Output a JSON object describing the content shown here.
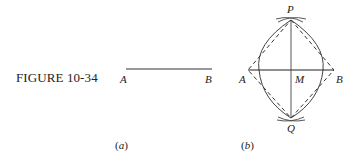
{
  "figure": {
    "caption": "FIGURE 10-34",
    "panel_a": {
      "label": "(a)",
      "point_left": "A",
      "point_right": "B"
    },
    "panel_b": {
      "label": "(b)",
      "point_top": "P",
      "point_bottom": "Q",
      "point_left": "A",
      "point_right": "B",
      "point_mid": "M"
    }
  }
}
